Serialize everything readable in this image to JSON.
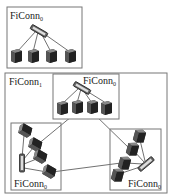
{
  "diagram": {
    "top_cell": {
      "label": "FiConn",
      "subscript": "0"
    },
    "outer_cell": {
      "label": "FiConn",
      "subscript": "1"
    },
    "inner_cells": [
      {
        "label": "FiConn",
        "subscript": "0",
        "position": "top"
      },
      {
        "label": "FiConn",
        "subscript": "0",
        "position": "bottom-left"
      },
      {
        "label": "FiConn",
        "subscript": "0",
        "position": "bottom-right"
      }
    ],
    "colors": {
      "border": "#777777",
      "line": "#333333",
      "server": "#444444",
      "switch": "#555555"
    }
  }
}
